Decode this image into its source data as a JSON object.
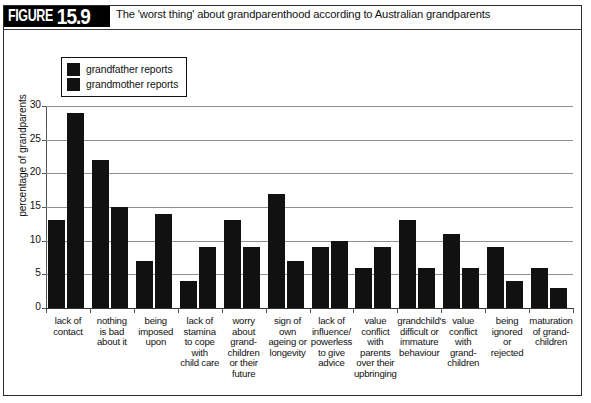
{
  "figure": {
    "tag_word": "FIGURE",
    "number": "15.9",
    "caption": "The 'worst thing' about grandparenthood according to Australian grandparents"
  },
  "legend": {
    "position": "top-left-inside",
    "entries": [
      {
        "label": "grandfather reports",
        "color": "#111111"
      },
      {
        "label": "grandmother reports",
        "color": "#111111"
      }
    ]
  },
  "chart_data": {
    "type": "bar",
    "title": "The 'worst thing' about grandparenthood according to Australian grandparents",
    "xlabel": "",
    "ylabel": "percentage of grandparents",
    "ylim": [
      0,
      30
    ],
    "yticks": [
      0,
      5,
      10,
      15,
      20,
      25,
      30
    ],
    "ytick_labels": [
      "0",
      "5",
      "10",
      "15",
      "20",
      "25",
      "30"
    ],
    "grid": true,
    "legend_position": "top-left-inside",
    "categories": [
      "lack of contact",
      "nothing is bad about it",
      "being imposed upon",
      "lack of stamina to cope with child care",
      "worry about grand-children or their future",
      "sign of own ageing or longevity",
      "lack of influence/ powerless to give advice",
      "value conflict with parents over their upbringing",
      "grandchild's difficult or immature behaviour",
      "value conflict with grand-children",
      "being ignored or rejected",
      "maturation of grand-children"
    ],
    "category_lines": [
      [
        "lack of",
        "contact"
      ],
      [
        "nothing",
        "is bad",
        "about it"
      ],
      [
        "being",
        "imposed",
        "upon"
      ],
      [
        "lack of",
        "stamina",
        "to cope",
        "with",
        "child care"
      ],
      [
        "worry",
        "about",
        "grand-",
        "children",
        "or their",
        "future"
      ],
      [
        "sign of",
        "own",
        "ageing or",
        "longevity"
      ],
      [
        "lack of",
        "influence/",
        "powerless",
        "to give",
        "advice"
      ],
      [
        "value",
        "conflict",
        "with",
        "parents",
        "over their",
        "upbringing"
      ],
      [
        "grandchild's",
        "difficult or",
        "immature",
        "behaviour"
      ],
      [
        "value",
        "conflict",
        "with",
        "grand-",
        "children"
      ],
      [
        "being",
        "ignored",
        "or",
        "rejected"
      ],
      [
        "maturation",
        "of grand-",
        "children"
      ]
    ],
    "series": [
      {
        "name": "grandfather reports",
        "color": "#111111",
        "values": [
          13,
          22,
          7,
          4,
          13,
          17,
          9,
          6,
          13,
          11,
          9,
          6
        ]
      },
      {
        "name": "grandmother reports",
        "color": "#111111",
        "values": [
          29,
          15,
          14,
          9,
          9,
          7,
          10,
          9,
          6,
          6,
          4,
          3
        ]
      }
    ]
  },
  "colors": {
    "bar": "#111111",
    "grid": "#8e8e8e",
    "axis": "#555555",
    "frame": "#2b2b2b",
    "header_bg": "#000000",
    "header_text": "#ffffff"
  }
}
